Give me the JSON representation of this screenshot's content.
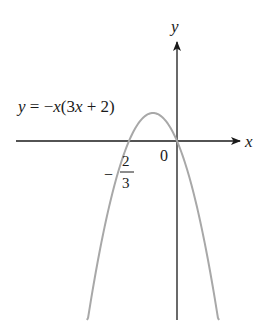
{
  "figure": {
    "type": "function-graph",
    "equation_label": "y = −x(3x + 2)",
    "equation_parts": {
      "y": "y",
      "eq": " = −",
      "x1": "x",
      "open": "(3",
      "x2": "x",
      "rest": " + 2)"
    },
    "x_axis_label": "x",
    "y_axis_label": "y",
    "origin_label": "0",
    "root_label": {
      "sign": "−",
      "numerator": "2",
      "denominator": "3"
    },
    "colors": {
      "axes": "#1a1a1a",
      "curve": "#a8a8a8",
      "text": "#1a1a1a"
    }
  },
  "chart_data": {
    "type": "line",
    "title": "y = −x(3x + 2)",
    "xlabel": "x",
    "ylabel": "y",
    "function": "y = -x(3x+2)",
    "roots": [
      -0.6667,
      0
    ],
    "vertex": {
      "x": -0.3333,
      "y": 0.3333
    },
    "labeled_points": [
      {
        "label": "0",
        "x": 0,
        "y": 0
      },
      {
        "label": "-2/3",
        "x": -0.6667,
        "y": 0
      }
    ],
    "x": [
      -1.25,
      -1.0,
      -0.6667,
      -0.5,
      -0.3333,
      -0.1667,
      0,
      0.25,
      0.5833
    ],
    "series": [
      {
        "name": "y = -x(3x+2)",
        "values": [
          -2.1875,
          -1.0,
          0,
          0.25,
          0.3333,
          0.25,
          0,
          -0.6875,
          -2.1875
        ]
      }
    ],
    "xlim": [
      -2.4,
      1.25
    ],
    "ylim": [
      -2.2,
      1.4
    ],
    "grid": false,
    "legend": "none"
  }
}
